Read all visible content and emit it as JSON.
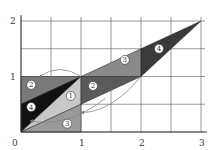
{
  "diagram": {
    "type": "geometric-transformation",
    "axes": {
      "x_ticks": [
        "0",
        "1",
        "2",
        "3"
      ],
      "y_ticks": [
        "1",
        "2"
      ],
      "origin_label": "0",
      "x_range": [
        0,
        3
      ],
      "y_range": [
        0,
        2
      ],
      "grid_step": 0.5
    },
    "regions": [
      {
        "id": "2",
        "label": "2",
        "points": [
          [
            0,
            1
          ],
          [
            1,
            1
          ],
          [
            0,
            0.5
          ]
        ],
        "color": "#7a7a7a"
      },
      {
        "id": "4",
        "label": "4",
        "points": [
          [
            0,
            0.5
          ],
          [
            1,
            1
          ],
          [
            0,
            0
          ]
        ],
        "color": "#111111"
      },
      {
        "id": "1",
        "label": "1",
        "points": [
          [
            0,
            0
          ],
          [
            1,
            1
          ],
          [
            1,
            0.5
          ]
        ],
        "color": "#c8c8c8"
      },
      {
        "id": "3",
        "label": "3",
        "points": [
          [
            0,
            0
          ],
          [
            1,
            0.5
          ],
          [
            1,
            0
          ]
        ],
        "color": "#9a9a9a"
      },
      {
        "id": "2b",
        "label": "2",
        "points": [
          [
            1,
            1
          ],
          [
            2,
            1
          ],
          [
            1,
            0.5
          ]
        ],
        "color": "#5a5a5a"
      },
      {
        "id": "3b",
        "label": "3",
        "points": [
          [
            1,
            1
          ],
          [
            2,
            1.5
          ],
          [
            2,
            1
          ]
        ],
        "color": "#8a8a8a"
      },
      {
        "id": "4b",
        "label": "4",
        "points": [
          [
            2,
            1
          ],
          [
            2,
            1.5
          ],
          [
            3,
            2
          ]
        ],
        "color": "#3a3a3a"
      }
    ],
    "label_positions": [
      {
        "label": "2",
        "at": [
          0.17,
          0.85
        ]
      },
      {
        "label": "4",
        "at": [
          0.17,
          0.45
        ]
      },
      {
        "label": "1",
        "at": [
          0.83,
          0.65
        ]
      },
      {
        "label": "3",
        "at": [
          0.77,
          0.15
        ]
      },
      {
        "label": "2",
        "at": [
          1.2,
          0.83
        ]
      },
      {
        "label": "3",
        "at": [
          1.73,
          1.3
        ]
      },
      {
        "label": "4",
        "at": [
          2.3,
          1.5
        ]
      }
    ],
    "arcs": [
      {
        "from": [
          1,
          1
        ],
        "to": [
          0.3,
          1
        ],
        "note": "arrow arc from (1,1) back to top-left"
      },
      {
        "from": [
          1.4,
          0.6
        ],
        "to": [
          0.15,
          0.2
        ],
        "note": "arrow arc curving to lower-left"
      },
      {
        "from": [
          2,
          1
        ],
        "to": [
          1,
          0.35
        ],
        "note": "arrow arc from (2,1) to right edge of square"
      }
    ]
  }
}
